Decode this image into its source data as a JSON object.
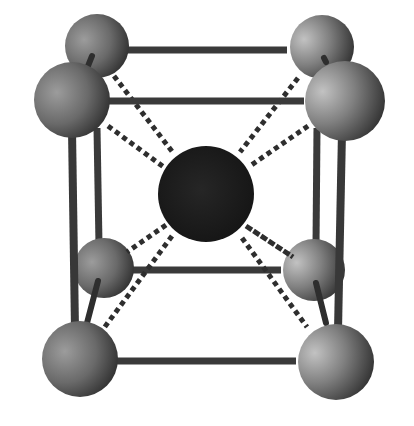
{
  "figure": {
    "subject": "Body-centered cubic unit cell",
    "background": "#ffffff",
    "colors": {
      "corner_atom_light": "#b4b4b4",
      "corner_atom_mid": "#7a7a7a",
      "corner_atom_dark": "#333333",
      "center_atom": "#1c1c1c",
      "rod": "#3a3a3a",
      "dashed_bond": "#2e2e2e"
    },
    "corner_atoms": [
      {
        "id": "back-top-left",
        "cx": 97,
        "cy": 46,
        "r": 32
      },
      {
        "id": "back-top-right",
        "cx": 322,
        "cy": 47,
        "r": 32
      },
      {
        "id": "back-bottom-left",
        "cx": 104,
        "cy": 268,
        "r": 30
      },
      {
        "id": "back-bottom-right",
        "cx": 314,
        "cy": 270,
        "r": 31
      },
      {
        "id": "front-top-left",
        "cx": 72,
        "cy": 100,
        "r": 38
      },
      {
        "id": "front-top-right",
        "cx": 345,
        "cy": 101,
        "r": 40
      },
      {
        "id": "front-bottom-left",
        "cx": 80,
        "cy": 359,
        "r": 38
      },
      {
        "id": "front-bottom-right",
        "cx": 336,
        "cy": 362,
        "r": 38
      }
    ],
    "center_atom": {
      "id": "body-center",
      "cx": 206,
      "cy": 194,
      "r": 48
    }
  }
}
